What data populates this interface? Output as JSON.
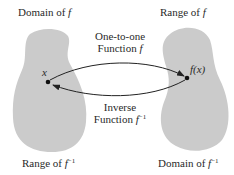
{
  "diagram": {
    "colors": {
      "blob": "#cbcbcb",
      "arrow": "#222222",
      "text": "#2a2a2a",
      "background": "#ffffff"
    },
    "labels": {
      "domain_f": "Domain of ",
      "domain_f_var": "f",
      "range_f": "Range of ",
      "range_f_var": "f",
      "range_f_inv": "Range of ",
      "range_f_inv_var": "f",
      "range_f_inv_sup": "−1",
      "domain_f_inv": "Domain of ",
      "domain_f_inv_var": "f",
      "domain_f_inv_sup": "−1",
      "forward_line1": "One-to-one",
      "forward_line2": "Function ",
      "forward_var": "f",
      "inverse_line1": "Inverse",
      "inverse_line2": "Function ",
      "inverse_var": "f",
      "inverse_sup": "−1",
      "point_x": "x",
      "point_fx": "f(x)"
    }
  }
}
